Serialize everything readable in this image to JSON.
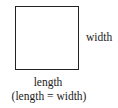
{
  "diagram": {
    "shape": "square",
    "labels": {
      "side_right": "width",
      "side_bottom": "length",
      "relation": "(length = width)"
    },
    "colors": {
      "stroke": "#222222",
      "text": "#1a1a1a",
      "background": "#ffffff"
    }
  }
}
